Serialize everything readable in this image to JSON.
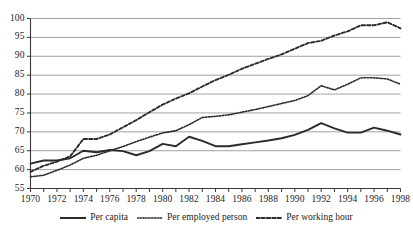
{
  "chart_data": {
    "type": "line",
    "title": "",
    "xlabel": "",
    "ylabel": "",
    "xlim": [
      1970,
      1998
    ],
    "ylim": [
      55,
      100
    ],
    "yticks": [
      55,
      60,
      65,
      70,
      75,
      80,
      85,
      90,
      95,
      100
    ],
    "grid": true,
    "grid_axis": "y",
    "legend_position": "bottom",
    "x": [
      1970,
      1971,
      1972,
      1973,
      1974,
      1975,
      1976,
      1977,
      1978,
      1979,
      1980,
      1981,
      1982,
      1983,
      1984,
      1985,
      1986,
      1987,
      1988,
      1989,
      1990,
      1991,
      1992,
      1993,
      1994,
      1995,
      1996,
      1997,
      1998
    ],
    "xtick_labels": [
      "1970",
      "1972",
      "1974",
      "1976",
      "1978",
      "1980",
      "1982",
      "1984",
      "1986",
      "1988",
      "1990",
      "1992",
      "1994",
      "1996",
      "1998"
    ],
    "series": [
      {
        "name": "Per capita",
        "style": "solid",
        "color": "#2b2b2b",
        "values": [
          61.6,
          62.4,
          62.4,
          63.0,
          65.0,
          64.6,
          65.2,
          64.9,
          63.8,
          64.9,
          66.8,
          66.2,
          68.7,
          67.6,
          66.2,
          66.2,
          66.7,
          67.2,
          67.7,
          68.3,
          69.2,
          70.5,
          72.3,
          70.9,
          69.8,
          69.8,
          71.1,
          70.3,
          69.3
        ]
      },
      {
        "name": "Per employed person",
        "style": "dotted",
        "color": "#2b2b2b",
        "values": [
          58.1,
          58.5,
          59.8,
          61.2,
          63.0,
          63.8,
          65.0,
          66.1,
          67.4,
          68.6,
          69.7,
          70.3,
          71.9,
          73.8,
          74.1,
          74.5,
          75.2,
          75.9,
          76.7,
          77.5,
          78.3,
          79.6,
          82.2,
          81.1,
          82.6,
          84.3,
          84.3,
          84.0,
          82.6
        ]
      },
      {
        "name": "Per working hour",
        "style": "dashed",
        "color": "#2b2b2b",
        "values": [
          59.4,
          61.0,
          62.1,
          63.5,
          68.1,
          68.1,
          69.3,
          71.2,
          73.1,
          75.2,
          77.2,
          78.8,
          80.2,
          82.0,
          83.7,
          85.1,
          86.7,
          88.0,
          89.3,
          90.5,
          92.0,
          93.5,
          94.1,
          95.5,
          96.6,
          98.2,
          98.2,
          99.0,
          97.4
        ]
      }
    ]
  },
  "legend": {
    "items": [
      {
        "label": "Per capita"
      },
      {
        "label": "Per employed person"
      },
      {
        "label": "Per working hour"
      }
    ]
  }
}
